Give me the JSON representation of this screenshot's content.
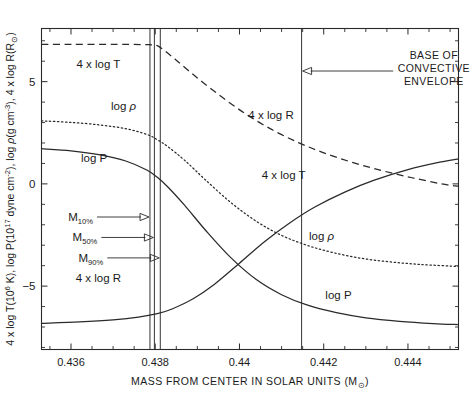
{
  "chart_data": {
    "type": "line",
    "title": "",
    "xlabel": "MASS FROM CENTER IN SOLAR UNITS (M⊙)",
    "ylabel": "4 x log T(10⁶ K), log P(10¹⁷ dyne cm⁻²), log ρ(g cm⁻³), 4 x log R(R⊙)",
    "xlim": [
      0.4353,
      0.4452
    ],
    "ylim": [
      -8.1,
      7.6
    ],
    "grid": false,
    "legend": "inline-labels",
    "xticks": [
      "0.436",
      "0.438",
      "0.44",
      "0.442",
      "0.444"
    ],
    "xtick_values": [
      0.436,
      0.438,
      0.44,
      0.442,
      0.444
    ],
    "yticks": [
      "5",
      "0",
      "-5"
    ],
    "ytick_values": [
      5,
      0,
      -5
    ],
    "xminor_step": 0.0005,
    "yminor_step": 1,
    "series": [
      {
        "name": "4 x log T",
        "style": "dashed",
        "label": "4 x log T",
        "label_positions": [
          {
            "x": 0.43665,
            "y": 5.85
          },
          {
            "x": 0.44105,
            "y": 0.45
          }
        ],
        "x": [
          0.4353,
          0.436,
          0.4368,
          0.4374,
          0.4378,
          0.43795,
          0.43805,
          0.4382,
          0.4385,
          0.439,
          0.4396,
          0.4402,
          0.4408,
          0.4414,
          0.442,
          0.4427,
          0.4434,
          0.4441,
          0.4448,
          0.4452
        ],
        "y": [
          6.82,
          6.82,
          6.82,
          6.82,
          6.81,
          6.8,
          6.76,
          6.55,
          6.05,
          5.18,
          4.22,
          3.35,
          2.62,
          2.02,
          1.52,
          1.04,
          0.64,
          0.3,
          0.0,
          -0.12
        ]
      },
      {
        "name": "log ρ",
        "style": "dotted",
        "label": "log ρ",
        "label_positions": [
          {
            "x": 0.43725,
            "y": 3.82
          },
          {
            "x": 0.44195,
            "y": -2.55
          }
        ],
        "x": [
          0.4353,
          0.436,
          0.4367,
          0.4373,
          0.4378,
          0.43805,
          0.4383,
          0.4387,
          0.4392,
          0.4398,
          0.4404,
          0.441,
          0.4416,
          0.4422,
          0.4429,
          0.4436,
          0.4443,
          0.4452
        ],
        "y": [
          3.08,
          3.01,
          2.88,
          2.7,
          2.42,
          2.16,
          1.82,
          1.15,
          0.18,
          -0.92,
          -1.83,
          -2.52,
          -3.0,
          -3.35,
          -3.64,
          -3.82,
          -3.94,
          -4.04
        ]
      },
      {
        "name": "log P",
        "style": "solid",
        "label": "log P",
        "label_positions": [
          {
            "x": 0.43655,
            "y": 1.28
          },
          {
            "x": 0.44235,
            "y": -5.45
          }
        ],
        "x": [
          0.4353,
          0.436,
          0.4367,
          0.4373,
          0.4378,
          0.43805,
          0.4383,
          0.4387,
          0.4392,
          0.4398,
          0.4404,
          0.441,
          0.4416,
          0.4423,
          0.443,
          0.4438,
          0.4446,
          0.4452
        ],
        "y": [
          1.72,
          1.62,
          1.42,
          1.12,
          0.68,
          0.32,
          -0.15,
          -1.05,
          -2.28,
          -3.62,
          -4.68,
          -5.42,
          -5.92,
          -6.3,
          -6.55,
          -6.72,
          -6.83,
          -6.88
        ]
      },
      {
        "name": "4 x log R",
        "style": "solid",
        "label": "4 x log R",
        "label_positions": [
          {
            "x": 0.43665,
            "y": -4.62
          },
          {
            "x": 0.44075,
            "y": 3.38
          }
        ],
        "x": [
          0.4353,
          0.4362,
          0.437,
          0.4376,
          0.43805,
          0.4384,
          0.4389,
          0.4394,
          0.44,
          0.4406,
          0.4412,
          0.4418,
          0.4425,
          0.4432,
          0.444,
          0.4448,
          0.4452
        ],
        "y": [
          -6.82,
          -6.75,
          -6.65,
          -6.52,
          -6.35,
          -6.12,
          -5.62,
          -4.92,
          -3.88,
          -2.82,
          -1.9,
          -1.12,
          -0.4,
          0.18,
          0.7,
          1.08,
          1.22
        ]
      }
    ],
    "vertical_markers": [
      {
        "name": "M_10",
        "label": "M",
        "sublabel": "10%",
        "x": 0.437875
      },
      {
        "name": "M_50",
        "label": "M",
        "sublabel": "50%",
        "x": 0.43798
      },
      {
        "name": "M_90",
        "label": "M",
        "sublabel": "90%",
        "x": 0.43812
      },
      {
        "name": "base-of-convective-envelope",
        "label": "",
        "sublabel": "",
        "x": 0.441475
      }
    ],
    "annotations": [
      {
        "name": "base-of-convective-envelope",
        "lines": [
          "BASE OF",
          "CONVECTIVE",
          "ENVELOPE"
        ],
        "text": "BASE OF CONVECTIVE ENVELOPE",
        "arrow_from_x": 0.44365,
        "arrow_to_x": 0.441475,
        "y": 5.52
      }
    ],
    "mass_fraction_labels": [
      {
        "label": "M",
        "sub": "10%",
        "target_x": 0.437875,
        "y": -1.62
      },
      {
        "label": "M",
        "sub": "50%",
        "target_x": 0.43798,
        "y": -2.62
      },
      {
        "label": "M",
        "sub": "90%",
        "target_x": 0.43812,
        "y": -3.62
      }
    ],
    "ylabel_parts": {
      "p1": "4 x log T(10",
      "p1sup": "6",
      "p2": " K), log P(10",
      "p2sup": "17",
      "p3": " dyne cm",
      "p3sup": "-2",
      "p4": "), log ",
      "rho": "ρ",
      "p5": "(g cm",
      "p5sup": "-3",
      "p6": "), 4 x log R(R",
      "p6sub": "⊙",
      "p7": ")"
    },
    "xlabel_parts": {
      "main": "MASS FROM CENTER IN SOLAR UNITS (M",
      "sub": "⊙",
      "tail": ")"
    },
    "colors": {
      "axis": "#2a2a2a",
      "curve": "#2a2a2a",
      "background": "#ffffff"
    }
  }
}
